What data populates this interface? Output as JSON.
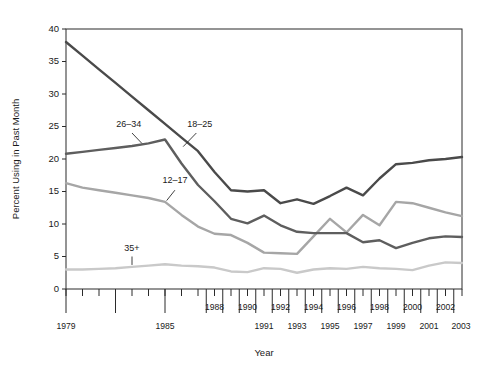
{
  "chart_data": {
    "type": "line",
    "title": "",
    "xlabel": "Year",
    "ylabel": "Percent Using in Past Month",
    "ylim": [
      0,
      40
    ],
    "xlim": [
      1979,
      2003
    ],
    "yticks": [
      0,
      5,
      10,
      15,
      20,
      25,
      30,
      35,
      40
    ],
    "grid": false,
    "legend_position": "inline-labels",
    "x": [
      1979,
      1980,
      1981,
      1982,
      1983,
      1984,
      1985,
      1986,
      1987,
      1988,
      1989,
      1990,
      1991,
      1992,
      1993,
      1994,
      1995,
      1996,
      1997,
      1998,
      1999,
      2000,
      2001,
      2002,
      2003
    ],
    "series": [
      {
        "name": "18–25",
        "color": "#4a4a4a",
        "label_x": 1987.1,
        "label_y": 25.0,
        "values": [
          38.0,
          35.9,
          33.8,
          31.7,
          29.6,
          27.5,
          25.4,
          23.3,
          21.2,
          18.0,
          15.2,
          15.0,
          15.2,
          13.2,
          13.8,
          13.1,
          14.3,
          15.6,
          14.4,
          17.0,
          19.2,
          19.4,
          19.8,
          20.0,
          20.3
        ],
        "label_leader": {
          "x1": 1986.9,
          "y1": 24.0,
          "x2": 1986.1,
          "y2": 21.9
        }
      },
      {
        "name": "26–34",
        "color": "#5e5e5e",
        "label_x": 1982.8,
        "label_y": 25.0,
        "values": [
          20.8,
          21.1,
          21.4,
          21.7,
          22.0,
          22.4,
          23.0,
          19.3,
          16.0,
          13.5,
          10.8,
          10.1,
          11.3,
          9.8,
          8.8,
          8.6,
          8.6,
          8.6,
          7.2,
          7.5,
          6.3,
          7.1,
          7.8,
          8.1,
          8.0
        ],
        "label_leader": {
          "x1": 1983.0,
          "y1": 24.0,
          "x2": 1983.6,
          "y2": 22.4
        }
      },
      {
        "name": "12–17",
        "color": "#a6a6a6",
        "label_x": 1985.6,
        "label_y": 16.3,
        "values": [
          16.3,
          15.6,
          15.2,
          14.8,
          14.4,
          14.0,
          13.4,
          11.4,
          9.6,
          8.5,
          8.3,
          7.1,
          5.6,
          5.5,
          5.4,
          8.1,
          10.8,
          8.7,
          11.4,
          9.8,
          13.4,
          13.2,
          12.5,
          11.8,
          11.2
        ],
        "label_leader": {
          "x1": 1985.6,
          "y1": 15.2,
          "x2": 1985.1,
          "y2": 13.6
        }
      },
      {
        "name": "35+",
        "color": "#c9c9c9",
        "label_x": 1983.0,
        "label_y": 5.8,
        "values": [
          3.0,
          3.0,
          3.1,
          3.2,
          3.4,
          3.6,
          3.8,
          3.6,
          3.5,
          3.3,
          2.7,
          2.6,
          3.2,
          3.1,
          2.5,
          3.0,
          3.2,
          3.1,
          3.4,
          3.2,
          3.1,
          2.9,
          3.6,
          4.1,
          4.0
        ],
        "label_leader": {
          "x1": 1983.0,
          "y1": 5.0,
          "x2": 1983.0,
          "y2": 3.7
        }
      }
    ],
    "xtick_labels_upper": [
      {
        "year": 1988,
        "text": "1988"
      },
      {
        "year": 1990,
        "text": "1990"
      },
      {
        "year": 1992,
        "text": "1992"
      },
      {
        "year": 1994,
        "text": "1994"
      },
      {
        "year": 1996,
        "text": "1996"
      },
      {
        "year": 1998,
        "text": "1998"
      },
      {
        "year": 2000,
        "text": "2000"
      },
      {
        "year": 2002,
        "text": "2002"
      }
    ],
    "xtick_labels_lower": [
      {
        "year": 1979,
        "text": "1979"
      },
      {
        "year": 1985,
        "text": "1985"
      },
      {
        "year": 1991,
        "text": "1991"
      },
      {
        "year": 1993,
        "text": "1993"
      },
      {
        "year": 1995,
        "text": "1995"
      },
      {
        "year": 1997,
        "text": "1997"
      },
      {
        "year": 1999,
        "text": "1999"
      },
      {
        "year": 2001,
        "text": "2001"
      },
      {
        "year": 2003,
        "text": "2003"
      }
    ]
  }
}
